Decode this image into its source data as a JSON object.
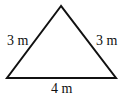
{
  "diagram": {
    "shape": "isosceles-triangle",
    "stroke_color": "#111111",
    "vertices": {
      "apex": [
        61,
        6
      ],
      "bottom_left": [
        7,
        78
      ],
      "bottom_right": [
        116,
        78
      ]
    },
    "labels": {
      "left_side": "3 m",
      "right_side": "3 m",
      "base": "4 m"
    }
  }
}
